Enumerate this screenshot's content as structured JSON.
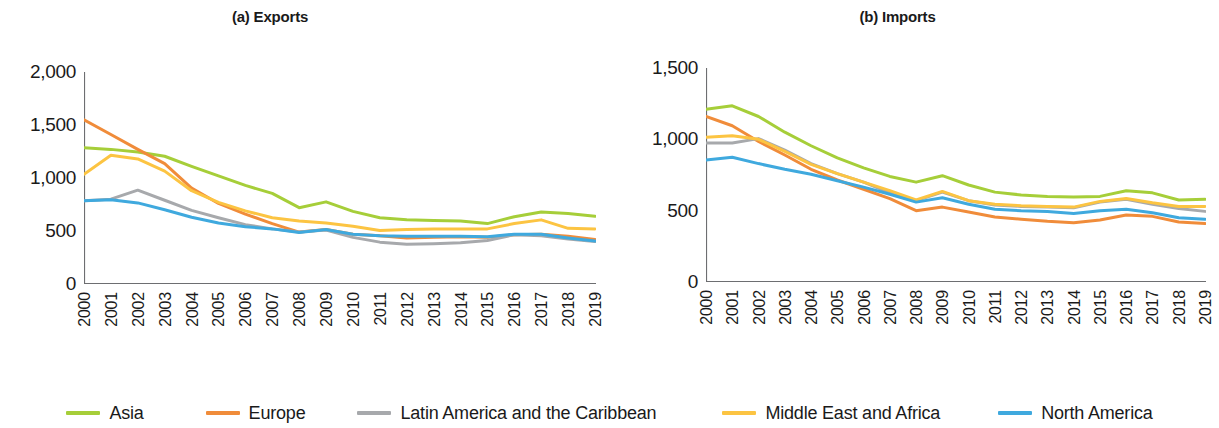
{
  "figure": {
    "background": "#ffffff"
  },
  "legend": {
    "position": "bottom-center",
    "items": [
      {
        "label": "Asia",
        "color": "#A6CE39",
        "swatch_name": "legend-swatch-asia"
      },
      {
        "label": "Europe",
        "color": "#F08C3A",
        "swatch_name": "legend-swatch-europe"
      },
      {
        "label": "Latin America and the Caribbean",
        "color": "#A7A9AC",
        "swatch_name": "legend-swatch-latin-america"
      },
      {
        "label": "Middle East and Africa",
        "color": "#FCC442",
        "swatch_name": "legend-swatch-middle-east-africa"
      },
      {
        "label": "North America",
        "color": "#3FA9DE",
        "swatch_name": "legend-swatch-north-america"
      }
    ],
    "gaps_px": [
      0,
      62,
      52,
      66,
      58
    ]
  },
  "chart_data": [
    {
      "type": "line",
      "panel": "a",
      "title": "(a) Exports",
      "xlabel": "",
      "ylabel": "",
      "x": [
        2000,
        2001,
        2002,
        2003,
        2004,
        2005,
        2006,
        2007,
        2008,
        2009,
        2010,
        2011,
        2012,
        2013,
        2014,
        2015,
        2016,
        2017,
        2018,
        2019
      ],
      "xtick_labels": [
        "2000",
        "2001",
        "2002",
        "2003",
        "2004",
        "2005",
        "2006",
        "2007",
        "2008",
        "2009",
        "2010",
        "2011",
        "2012",
        "2013",
        "2014",
        "2015",
        "2016",
        "2017",
        "2018",
        "2019"
      ],
      "ylim": [
        0,
        2000
      ],
      "yticks": [
        0,
        500,
        1000,
        1500,
        2000
      ],
      "ytick_labels": [
        "0",
        "500",
        "1,000",
        "1,500",
        "2,000"
      ],
      "grid": false,
      "series": [
        {
          "name": "Asia",
          "color": "#A6CE39",
          "values": [
            1285,
            1270,
            1245,
            1205,
            1110,
            1020,
            930,
            855,
            720,
            775,
            685,
            625,
            605,
            600,
            595,
            570,
            635,
            680,
            665,
            640
          ]
        },
        {
          "name": "Europe",
          "color": "#F08C3A",
          "values": [
            1550,
            1410,
            1270,
            1135,
            905,
            760,
            660,
            570,
            490,
            515,
            470,
            455,
            435,
            440,
            445,
            440,
            465,
            470,
            450,
            420
          ]
        },
        {
          "name": "Latin America and the Caribbean",
          "color": "#A7A9AC",
          "values": [
            785,
            800,
            885,
            790,
            695,
            625,
            560,
            520,
            490,
            510,
            440,
            395,
            375,
            380,
            390,
            410,
            465,
            455,
            425,
            400
          ]
        },
        {
          "name": "Middle East and Africa",
          "color": "#FCC442",
          "values": [
            1035,
            1215,
            1180,
            1065,
            880,
            770,
            690,
            625,
            595,
            575,
            545,
            505,
            515,
            520,
            520,
            520,
            570,
            605,
            525,
            520
          ]
        },
        {
          "name": "North America",
          "color": "#3FA9DE",
          "values": [
            785,
            795,
            765,
            700,
            630,
            575,
            540,
            520,
            485,
            515,
            470,
            455,
            450,
            450,
            450,
            445,
            470,
            470,
            435,
            405
          ]
        }
      ]
    },
    {
      "type": "line",
      "panel": "b",
      "title": "(b) Imports",
      "xlabel": "",
      "ylabel": "",
      "x": [
        2000,
        2001,
        2002,
        2003,
        2004,
        2005,
        2006,
        2007,
        2008,
        2009,
        2010,
        2011,
        2012,
        2013,
        2014,
        2015,
        2016,
        2017,
        2018,
        2019
      ],
      "xtick_labels": [
        "2000",
        "2001",
        "2002",
        "2003",
        "2004",
        "2005",
        "2006",
        "2007",
        "2008",
        "2009",
        "2010",
        "2011",
        "2012",
        "2013",
        "2014",
        "2015",
        "2016",
        "2017",
        "2018",
        "2019"
      ],
      "ylim": [
        0,
        1500
      ],
      "yticks": [
        0,
        500,
        1000,
        1500
      ],
      "ytick_labels": [
        "0",
        "500",
        "1,000",
        "1,500"
      ],
      "grid": false,
      "series": [
        {
          "name": "Asia",
          "color": "#A6CE39",
          "values": [
            1210,
            1235,
            1160,
            1050,
            955,
            870,
            800,
            740,
            700,
            745,
            680,
            630,
            610,
            600,
            595,
            600,
            640,
            625,
            575,
            580
          ]
        },
        {
          "name": "Europe",
          "color": "#F08C3A",
          "values": [
            1160,
            1095,
            985,
            890,
            790,
            715,
            650,
            585,
            500,
            525,
            490,
            455,
            440,
            425,
            415,
            435,
            470,
            460,
            420,
            410
          ]
        },
        {
          "name": "Latin America and the Caribbean",
          "color": "#A7A9AC",
          "values": [
            975,
            975,
            1005,
            925,
            830,
            760,
            700,
            625,
            570,
            630,
            570,
            540,
            530,
            525,
            520,
            560,
            580,
            545,
            515,
            495
          ]
        },
        {
          "name": "Middle East and Africa",
          "color": "#FCC442",
          "values": [
            1015,
            1025,
            1000,
            915,
            825,
            760,
            700,
            640,
            575,
            635,
            570,
            545,
            535,
            530,
            525,
            565,
            585,
            555,
            530,
            530
          ]
        },
        {
          "name": "North America",
          "color": "#3FA9DE",
          "values": [
            855,
            875,
            830,
            790,
            755,
            710,
            665,
            615,
            560,
            590,
            545,
            510,
            500,
            495,
            480,
            500,
            510,
            485,
            450,
            440
          ]
        }
      ]
    }
  ]
}
